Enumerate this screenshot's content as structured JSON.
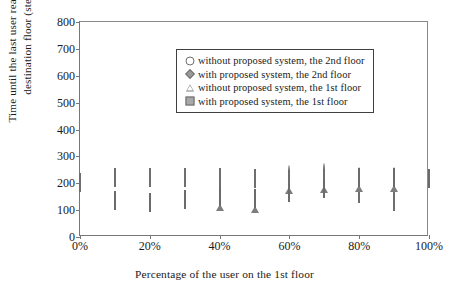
{
  "chart_data": {
    "type": "scatter",
    "title": "",
    "xlabel": "Percentage of the user on the 1st floor",
    "ylabel": "Time until the last user reaches the\ndestination floor (step)",
    "ylabel_line1": "Time until the last user reaches the",
    "ylabel_line2": "destination floor (step)",
    "x": [
      0,
      10,
      20,
      30,
      40,
      50,
      60,
      70,
      80,
      90,
      100
    ],
    "xtick_labels": [
      "0%",
      "20%",
      "40%",
      "60%",
      "80%",
      "100%"
    ],
    "xtick_values": [
      0,
      20,
      40,
      60,
      80,
      100
    ],
    "ytick_labels": [
      "0",
      "100",
      "200",
      "300",
      "400",
      "500",
      "600",
      "700",
      "800"
    ],
    "ytick_values": [
      0,
      100,
      200,
      300,
      400,
      500,
      600,
      700,
      800
    ],
    "xlim": [
      0,
      100
    ],
    "ylim": [
      0,
      800
    ],
    "grid": false,
    "legend_position": "upper-left-inside",
    "series": [
      {
        "name": "without proposed system, the 2nd floor",
        "marker": "open-circle",
        "color": "#6e6e6e",
        "x": [
          0,
          10,
          20,
          30,
          40,
          50,
          60,
          70,
          80,
          90
        ],
        "values": [
          200,
          220,
          220,
          219,
          220,
          215,
          230,
          240,
          225,
          222
        ]
      },
      {
        "name": "with proposed system, the 2nd floor",
        "marker": "filled-diamond",
        "color": "#9a9a9a",
        "x": [
          0,
          10,
          20,
          30,
          40,
          50,
          60,
          70,
          80,
          90
        ],
        "values": [
          200,
          220,
          219,
          218,
          219,
          216,
          211,
          215,
          160,
          130
        ]
      },
      {
        "name": "without proposed system, the 1st floor",
        "marker": "open-triangle",
        "color": "#7d7d7d",
        "x": [
          40,
          50,
          60,
          70,
          80,
          90
        ],
        "values": [
          152,
          145,
          215,
          218,
          222,
          225
        ]
      },
      {
        "name": "with proposed system, the 1st floor",
        "marker": "filled-square",
        "color": "#a8a8a8",
        "x": [
          10,
          20,
          30,
          40,
          50,
          60,
          70,
          80,
          90,
          100
        ],
        "values": [
          135,
          128,
          137,
          148,
          143,
          163,
          178,
          218,
          220,
          215
        ]
      }
    ],
    "legend": [
      {
        "label": "without proposed system, the 2nd floor",
        "marker": "open-circle"
      },
      {
        "label": "with proposed system, the 2nd floor",
        "marker": "filled-diamond"
      },
      {
        "label": "without proposed system, the 1st floor",
        "marker": "open-triangle"
      },
      {
        "label": "with proposed system, the 1st floor",
        "marker": "filled-square"
      }
    ]
  }
}
